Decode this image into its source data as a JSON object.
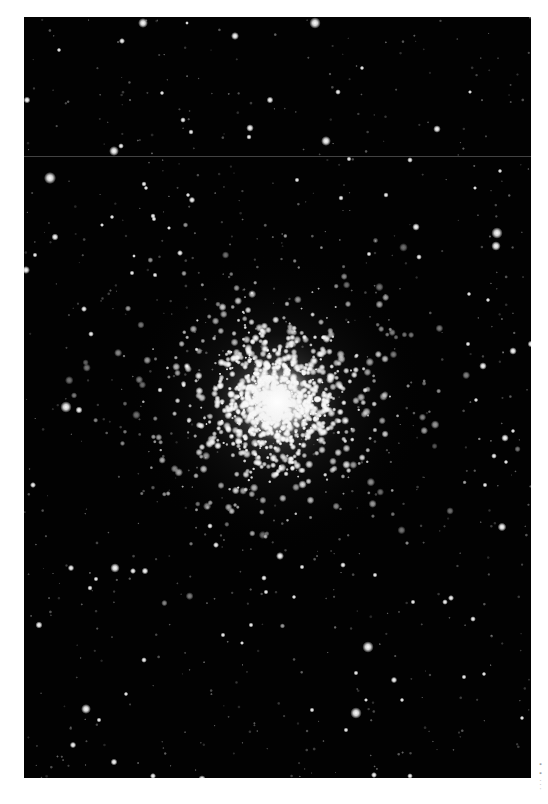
{
  "image": {
    "subject": "globular star cluster",
    "background_color": "#ffffff",
    "photo_background": "#020202",
    "photo_rect": {
      "x": 24,
      "y": 17,
      "width": 507,
      "height": 761
    },
    "scan_artifact_line_y": 139,
    "cluster": {
      "center_x": 253,
      "center_y": 385,
      "core_radius": 38,
      "halo_radius": 150,
      "star_count": 1400
    },
    "field_stars": [
      [
        119,
        6,
        2.6
      ],
      [
        98,
        24,
        1.6
      ],
      [
        35,
        33,
        1.2
      ],
      [
        3,
        83,
        1.8
      ],
      [
        138,
        76,
        1.2
      ],
      [
        159,
        103,
        1.5
      ],
      [
        167,
        115,
        1.4
      ],
      [
        226,
        111,
        2.0
      ],
      [
        90,
        134,
        2.6
      ],
      [
        97,
        129,
        1.5
      ],
      [
        26,
        161,
        3.2
      ],
      [
        120,
        167,
        1.4
      ],
      [
        122,
        171,
        1.2
      ],
      [
        168,
        183,
        1.7
      ],
      [
        164,
        178,
        1.2
      ],
      [
        31,
        220,
        1.9
      ],
      [
        129,
        199,
        1.4
      ],
      [
        130,
        202,
        1.3
      ],
      [
        78,
        208,
        1.1
      ],
      [
        145,
        211,
        1.1
      ],
      [
        2,
        253,
        2.1
      ],
      [
        11,
        238,
        1.3
      ],
      [
        88,
        200,
        1.2
      ],
      [
        110,
        239,
        1.0
      ],
      [
        156,
        236,
        1.6
      ],
      [
        131,
        258,
        1.3
      ],
      [
        211,
        19,
        2.1
      ],
      [
        163,
        6,
        1.0
      ],
      [
        291,
        6,
        3.0
      ],
      [
        314,
        75,
        1.5
      ],
      [
        338,
        51,
        1.2
      ],
      [
        246,
        83,
        1.8
      ],
      [
        302,
        124,
        2.6
      ],
      [
        225,
        120,
        1.4
      ],
      [
        413,
        112,
        2.0
      ],
      [
        325,
        142,
        1.3
      ],
      [
        386,
        143,
        1.5
      ],
      [
        362,
        178,
        1.4
      ],
      [
        273,
        163,
        1.3
      ],
      [
        392,
        210,
        2.0
      ],
      [
        473,
        216,
        3.0
      ],
      [
        472,
        229,
        2.5
      ],
      [
        317,
        181,
        1.4
      ],
      [
        395,
        240,
        1.5
      ],
      [
        345,
        237,
        1.3
      ],
      [
        446,
        75,
        1.1
      ],
      [
        451,
        171,
        1.1
      ],
      [
        476,
        154,
        1.2
      ],
      [
        42,
        390,
        3.0
      ],
      [
        55,
        393,
        1.9
      ],
      [
        9,
        468,
        1.6
      ],
      [
        136,
        373,
        1.4
      ],
      [
        60,
        292,
        1.6
      ],
      [
        67,
        317,
        1.5
      ],
      [
        108,
        256,
        1.3
      ],
      [
        459,
        349,
        2.0
      ],
      [
        489,
        334,
        2.0
      ],
      [
        507,
        327,
        1.8
      ],
      [
        481,
        421,
        2.0
      ],
      [
        478,
        510,
        2.3
      ],
      [
        489,
        414,
        1.2
      ],
      [
        470,
        439,
        1.5
      ],
      [
        482,
        445,
        1.2
      ],
      [
        444,
        327,
        1.3
      ],
      [
        445,
        277,
        1.2
      ],
      [
        464,
        283,
        1.2
      ],
      [
        461,
        468,
        1.3
      ],
      [
        452,
        383,
        1.2
      ],
      [
        91,
        551,
        2.5
      ],
      [
        109,
        554,
        1.6
      ],
      [
        121,
        554,
        1.8
      ],
      [
        47,
        551,
        1.7
      ],
      [
        66,
        571,
        1.4
      ],
      [
        72,
        562,
        1.3
      ],
      [
        15,
        608,
        1.9
      ],
      [
        120,
        643,
        1.5
      ],
      [
        102,
        677,
        1.2
      ],
      [
        62,
        692,
        2.6
      ],
      [
        75,
        703,
        1.3
      ],
      [
        49,
        728,
        1.7
      ],
      [
        90,
        745,
        1.8
      ],
      [
        129,
        759,
        1.6
      ],
      [
        178,
        762,
        2.0
      ],
      [
        186,
        509,
        1.5
      ],
      [
        192,
        528,
        1.6
      ],
      [
        227,
        608,
        1.3
      ],
      [
        218,
        626,
        1.1
      ],
      [
        199,
        618,
        1.3
      ],
      [
        256,
        539,
        2.1
      ],
      [
        240,
        561,
        1.5
      ],
      [
        242,
        575,
        1.3
      ],
      [
        278,
        550,
        1.3
      ],
      [
        319,
        548,
        1.5
      ],
      [
        351,
        558,
        1.3
      ],
      [
        344,
        630,
        3.0
      ],
      [
        332,
        656,
        1.3
      ],
      [
        332,
        696,
        3.0
      ],
      [
        288,
        693,
        1.3
      ],
      [
        322,
        713,
        1.3
      ],
      [
        350,
        758,
        1.6
      ],
      [
        386,
        759,
        1.5
      ],
      [
        389,
        585,
        1.3
      ],
      [
        421,
        585,
        1.5
      ],
      [
        427,
        581,
        1.6
      ],
      [
        449,
        602,
        1.5
      ],
      [
        440,
        660,
        1.3
      ],
      [
        498,
        701,
        1.2
      ],
      [
        421,
        769,
        1.5
      ],
      [
        370,
        663,
        1.7
      ],
      [
        378,
        683,
        1.2
      ],
      [
        342,
        683,
        1.1
      ],
      [
        460,
        657,
        1.2
      ],
      [
        295,
        765,
        1.4
      ],
      [
        270,
        580,
        1.2
      ]
    ]
  },
  "caption": {
    "text": "· · ·  ▪  ▪"
  }
}
